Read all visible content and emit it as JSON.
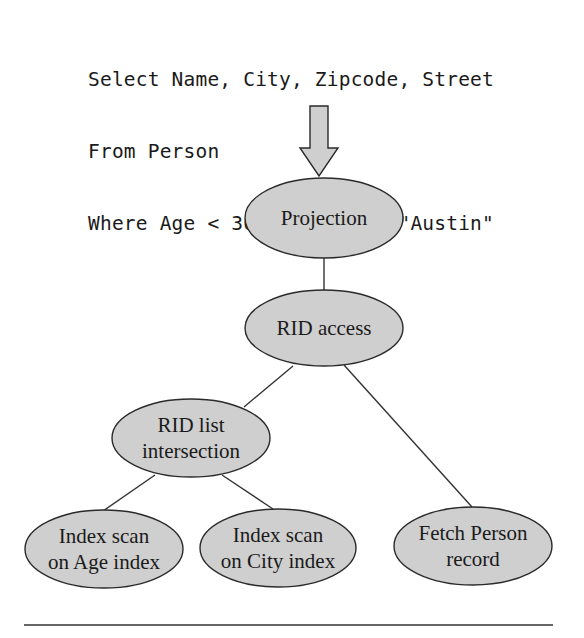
{
  "query": {
    "lines": [
      "Select Name, City, Zipcode, Street",
      "From Person",
      "Where Age < 30 And City = \"Austin\""
    ]
  },
  "colors": {
    "node_fill": "#cfcfcf",
    "stroke": "#2a2a2a",
    "text": "#1a1a1a"
  },
  "nodes": [
    {
      "id": "projection",
      "lines": [
        "Projection"
      ]
    },
    {
      "id": "rid-access",
      "lines": [
        "RID access"
      ]
    },
    {
      "id": "rid-list-intersection",
      "lines": [
        "RID list",
        "intersection"
      ]
    },
    {
      "id": "index-scan-age",
      "lines": [
        "Index scan",
        "on Age index"
      ]
    },
    {
      "id": "index-scan-city",
      "lines": [
        "Index scan",
        "on City index"
      ]
    },
    {
      "id": "fetch-person",
      "lines": [
        "Fetch Person",
        "record"
      ]
    }
  ],
  "edges": [
    {
      "from": "projection",
      "to": "rid-access"
    },
    {
      "from": "rid-access",
      "to": "rid-list-intersection"
    },
    {
      "from": "rid-access",
      "to": "fetch-person"
    },
    {
      "from": "rid-list-intersection",
      "to": "index-scan-age"
    },
    {
      "from": "rid-list-intersection",
      "to": "index-scan-city"
    }
  ]
}
